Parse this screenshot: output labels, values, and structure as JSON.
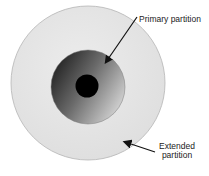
{
  "diagram": {
    "type": "concentric-disk-partitions",
    "labels": {
      "primary": "Primary partition",
      "extended_line1": "Extended",
      "extended_line2": "partition"
    },
    "colors": {
      "outer_fill": "#e4e4e4",
      "outer_stroke": "#b8b8b8",
      "middle_dark": "#2e2e2e",
      "middle_light": "#d8d8d8",
      "core": "#000000",
      "arrow": "#111111"
    },
    "regions": [
      {
        "name": "extended-partition",
        "cx": 88,
        "cy": 83,
        "r": 77
      },
      {
        "name": "primary-partition",
        "cx": 88,
        "cy": 87,
        "r": 37
      },
      {
        "name": "center-hole",
        "cx": 87,
        "cy": 86,
        "r": 11
      }
    ]
  }
}
